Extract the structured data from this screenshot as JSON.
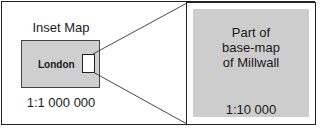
{
  "inset": {
    "title": "Inset Map",
    "label": "London",
    "scale": "1:1 000 000"
  },
  "detail": {
    "lines": [
      "Part of",
      "base-map",
      "of Millwall"
    ],
    "scale": "1:10 000"
  },
  "colors": {
    "map_fill": "#cfcfcf",
    "border": "#222222",
    "background": "#ffffff"
  }
}
